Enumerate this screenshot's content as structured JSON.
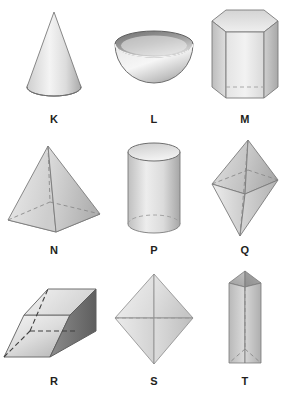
{
  "figure": {
    "background_color": "#ffffff",
    "label_color": "#231f20",
    "palette": {
      "light": "#f2f2f2",
      "mid": "#c9c9c9",
      "dark": "#8f8f8f",
      "darker": "#6e6e6e",
      "outline": "#7a7a7a",
      "hidden_edge": "#8a8a8a"
    },
    "rows": 3,
    "columns": 3
  },
  "shapes": [
    {
      "label": "K",
      "name": "cone",
      "row": 1,
      "column": 1
    },
    {
      "label": "L",
      "name": "hemisphere-bowl",
      "row": 1,
      "column": 2
    },
    {
      "label": "M",
      "name": "hexagonal-prism",
      "row": 1,
      "column": 3
    },
    {
      "label": "N",
      "name": "square-pyramid",
      "row": 2,
      "column": 1
    },
    {
      "label": "P",
      "name": "cylinder",
      "row": 2,
      "column": 2
    },
    {
      "label": "Q",
      "name": "elongated-octahedron",
      "row": 2,
      "column": 3
    },
    {
      "label": "R",
      "name": "parallelepiped",
      "row": 3,
      "column": 1
    },
    {
      "label": "S",
      "name": "octahedron-diamond",
      "row": 3,
      "column": 2
    },
    {
      "label": "T",
      "name": "vertical-triangular-prism",
      "row": 3,
      "column": 3
    }
  ]
}
